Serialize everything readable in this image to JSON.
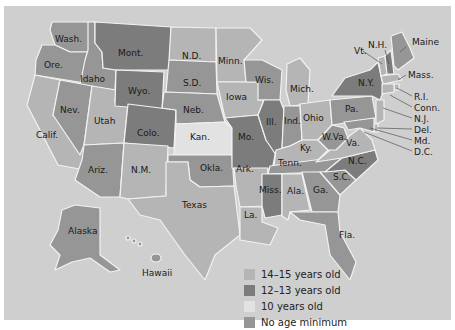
{
  "map": {
    "subject": "Minimum age requirements by U.S. state",
    "colors": {
      "background": "#cfcfcf",
      "border": "#f2f2f2",
      "14-15": "#b5b5b5",
      "12-13": "#7c7c7c",
      "10": "#e2e2e2",
      "none": "#969696"
    },
    "states": [
      {
        "label": "Wash.",
        "cat": "none"
      },
      {
        "label": "Ore.",
        "cat": "none"
      },
      {
        "label": "Calif.",
        "cat": "14-15"
      },
      {
        "label": "Idaho",
        "cat": "none"
      },
      {
        "label": "Nev.",
        "cat": "none"
      },
      {
        "label": "Utah",
        "cat": "14-15"
      },
      {
        "label": "Ariz.",
        "cat": "none"
      },
      {
        "label": "Mont.",
        "cat": "12-13"
      },
      {
        "label": "Wyo.",
        "cat": "12-13"
      },
      {
        "label": "Colo.",
        "cat": "12-13"
      },
      {
        "label": "N.M.",
        "cat": "14-15"
      },
      {
        "label": "N.D.",
        "cat": "14-15"
      },
      {
        "label": "S.D.",
        "cat": "none"
      },
      {
        "label": "Neb.",
        "cat": "none"
      },
      {
        "label": "Kan.",
        "cat": "10"
      },
      {
        "label": "Okla.",
        "cat": "none"
      },
      {
        "label": "Texas",
        "cat": "14-15"
      },
      {
        "label": "Minn.",
        "cat": "14-15"
      },
      {
        "label": "Iowa",
        "cat": "14-15"
      },
      {
        "label": "Mo.",
        "cat": "12-13"
      },
      {
        "label": "Ark.",
        "cat": "14-15"
      },
      {
        "label": "La.",
        "cat": "14-15"
      },
      {
        "label": "Wis.",
        "cat": "none"
      },
      {
        "label": "Ill.",
        "cat": "12-13"
      },
      {
        "label": "Mich.",
        "cat": "14-15"
      },
      {
        "label": "Ind.",
        "cat": "none"
      },
      {
        "label": "Ohio",
        "cat": "14-15"
      },
      {
        "label": "Ky.",
        "cat": "14-15"
      },
      {
        "label": "Tenn.",
        "cat": "none"
      },
      {
        "label": "Miss.",
        "cat": "12-13"
      },
      {
        "label": "Ala.",
        "cat": "14-15"
      },
      {
        "label": "Ga.",
        "cat": "none"
      },
      {
        "label": "Fla.",
        "cat": "none"
      },
      {
        "label": "S.C.",
        "cat": "none"
      },
      {
        "label": "N.C.",
        "cat": "12-13"
      },
      {
        "label": "Va.",
        "cat": "14-15"
      },
      {
        "label": "W.Va.",
        "cat": "none"
      },
      {
        "label": "Pa.",
        "cat": "none"
      },
      {
        "label": "N.Y.",
        "cat": "12-13"
      },
      {
        "label": "Vt.",
        "cat": "14-15"
      },
      {
        "label": "N.H.",
        "cat": "12-13"
      },
      {
        "label": "Maine",
        "cat": "none"
      },
      {
        "label": "Mass.",
        "cat": "14-15"
      },
      {
        "label": "R.I.",
        "cat": "14-15"
      },
      {
        "label": "Conn.",
        "cat": "14-15"
      },
      {
        "label": "N.J.",
        "cat": "14-15"
      },
      {
        "label": "Del.",
        "cat": "14-15"
      },
      {
        "label": "Md.",
        "cat": "none"
      },
      {
        "label": "D.C.",
        "cat": "14-15"
      },
      {
        "label": "Alaska",
        "cat": "none"
      },
      {
        "label": "Hawaii",
        "cat": "none"
      }
    ]
  },
  "legend": [
    {
      "key": "14-15",
      "label": "14–15 years old",
      "color": "#b5b5b5"
    },
    {
      "key": "12-13",
      "label": "12–13 years old",
      "color": "#7c7c7c"
    },
    {
      "key": "10",
      "label": "10 years old",
      "color": "#e2e2e2"
    },
    {
      "key": "none",
      "label": "No age minimum",
      "color": "#969696"
    }
  ]
}
